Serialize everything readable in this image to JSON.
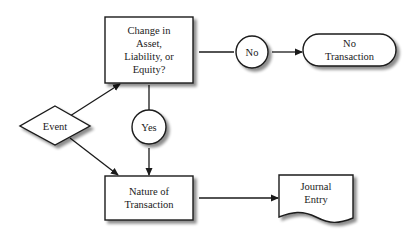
{
  "diagram": {
    "type": "flowchart",
    "colors": {
      "stroke": "#1a1a1a",
      "fill": "#ffffff",
      "shadow": "#9a9a9a"
    },
    "nodes": {
      "event": {
        "shape": "diamond",
        "label": "Event"
      },
      "decision": {
        "shape": "rectangle",
        "lines": [
          "Change in",
          "Asset,",
          "Liability, or",
          "Equity?"
        ]
      },
      "no": {
        "shape": "circle",
        "label": "No"
      },
      "no_transaction": {
        "shape": "terminator",
        "lines": [
          "No",
          "Transaction"
        ]
      },
      "yes": {
        "shape": "circle",
        "label": "Yes"
      },
      "nature": {
        "shape": "rectangle",
        "lines": [
          "Nature of",
          "Transaction"
        ]
      },
      "journal": {
        "shape": "document",
        "lines": [
          "Journal",
          "Entry"
        ]
      }
    },
    "edges": [
      {
        "from": "event",
        "to": "decision",
        "arrow": true
      },
      {
        "from": "event",
        "to": "nature",
        "arrow": true
      },
      {
        "from": "decision",
        "to": "no",
        "arrow": false
      },
      {
        "from": "no",
        "to": "no_transaction",
        "arrow": true
      },
      {
        "from": "decision",
        "to": "yes",
        "arrow": false
      },
      {
        "from": "yes",
        "to": "nature",
        "arrow": true
      },
      {
        "from": "nature",
        "to": "journal",
        "arrow": true
      }
    ]
  }
}
